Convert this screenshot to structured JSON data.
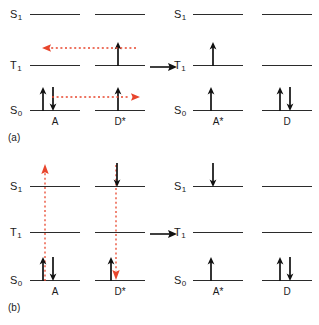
{
  "figure": {
    "colors": {
      "level_line": "#2b2b2b",
      "spin_arrow": "#111111",
      "transfer_arrow": "#e8452c",
      "reaction_arrow": "#111111",
      "text": "#1a1a1a",
      "background": "#ffffff"
    }
  },
  "state_labels": {
    "s1": "S",
    "s1_sub": "1",
    "t1": "T",
    "t1_sub": "1",
    "s0": "S",
    "s0_sub": "0"
  },
  "panels": [
    {
      "tag": "(a)",
      "mechanism_name": "dexter-energy-transfer",
      "left_group": {
        "columns": [
          {
            "species": "A",
            "name": "acceptor-ground",
            "levels": [
              "S1",
              "T1",
              "S0"
            ],
            "electrons": [
              {
                "level": "S0",
                "spin": "up"
              },
              {
                "level": "S0",
                "spin": "down"
              }
            ]
          },
          {
            "species": "D*",
            "name": "donor-excited-triplet",
            "levels": [
              "S1",
              "T1",
              "S0"
            ],
            "electrons": [
              {
                "level": "T1",
                "spin": "up"
              },
              {
                "level": "S0",
                "spin": "up"
              }
            ]
          }
        ]
      },
      "right_group": {
        "columns": [
          {
            "species": "A*",
            "name": "acceptor-excited-triplet",
            "levels": [
              "S1",
              "T1",
              "S0"
            ],
            "electrons": [
              {
                "level": "T1",
                "spin": "up"
              },
              {
                "level": "S0",
                "spin": "up"
              }
            ]
          },
          {
            "species": "D",
            "name": "donor-ground",
            "levels": [
              "S1",
              "T1",
              "S0"
            ],
            "electrons": [
              {
                "level": "S0",
                "spin": "up"
              },
              {
                "level": "S0",
                "spin": "down"
              }
            ]
          }
        ]
      },
      "transfer_arrows": [
        {
          "name": "triplet-electron-transfer",
          "orientation": "horizontal",
          "direction": "left",
          "from_level": "T1",
          "to_level": "T1",
          "style": "dotted"
        },
        {
          "name": "ground-electron-transfer",
          "orientation": "horizontal",
          "direction": "right",
          "from_level": "S0",
          "to_level": "S0",
          "style": "dotted"
        }
      ],
      "reaction_arrow": {
        "name": "reaction-arrow",
        "direction": "right"
      }
    },
    {
      "tag": "(b)",
      "mechanism_name": "forster-energy-transfer",
      "left_group": {
        "columns": [
          {
            "species": "A",
            "name": "acceptor-ground",
            "levels": [
              "S1",
              "T1",
              "S0"
            ],
            "electrons": [
              {
                "level": "S0",
                "spin": "up"
              },
              {
                "level": "S0",
                "spin": "down"
              }
            ]
          },
          {
            "species": "D*",
            "name": "donor-excited-singlet",
            "levels": [
              "S1",
              "T1",
              "S0"
            ],
            "electrons": [
              {
                "level": "S1",
                "spin": "down"
              },
              {
                "level": "S0",
                "spin": "up"
              }
            ]
          }
        ]
      },
      "right_group": {
        "columns": [
          {
            "species": "A*",
            "name": "acceptor-excited-singlet",
            "levels": [
              "S1",
              "T1",
              "S0"
            ],
            "electrons": [
              {
                "level": "S1",
                "spin": "down"
              },
              {
                "level": "S0",
                "spin": "up"
              }
            ]
          },
          {
            "species": "D",
            "name": "donor-ground",
            "levels": [
              "S1",
              "T1",
              "S0"
            ],
            "electrons": [
              {
                "level": "S0",
                "spin": "up"
              },
              {
                "level": "S0",
                "spin": "down"
              }
            ]
          }
        ]
      },
      "transfer_arrows": [
        {
          "name": "acceptor-excitation",
          "orientation": "vertical",
          "direction": "up",
          "from_level": "S0",
          "to_level": "S1",
          "style": "dotted"
        },
        {
          "name": "donor-relaxation",
          "orientation": "vertical",
          "direction": "down",
          "from_level": "S1",
          "to_level": "S0",
          "style": "dotted"
        }
      ],
      "reaction_arrow": {
        "name": "reaction-arrow",
        "direction": "right"
      }
    }
  ]
}
